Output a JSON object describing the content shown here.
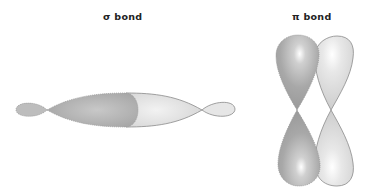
{
  "diagram": {
    "sigma": {
      "title": "σ bond",
      "description": "Head-on overlap of two p orbitals along the internuclear axis"
    },
    "pi": {
      "title": "π bond",
      "description": "Side-by-side overlap of two parallel p orbitals"
    }
  },
  "colors": {
    "dark_lobe": "#a9a9a9",
    "light_lobe": "#dcdcdc",
    "outline": "#8a8a8a",
    "highlight": "#ffffff",
    "background": "#ffffff",
    "text": "#222222"
  }
}
